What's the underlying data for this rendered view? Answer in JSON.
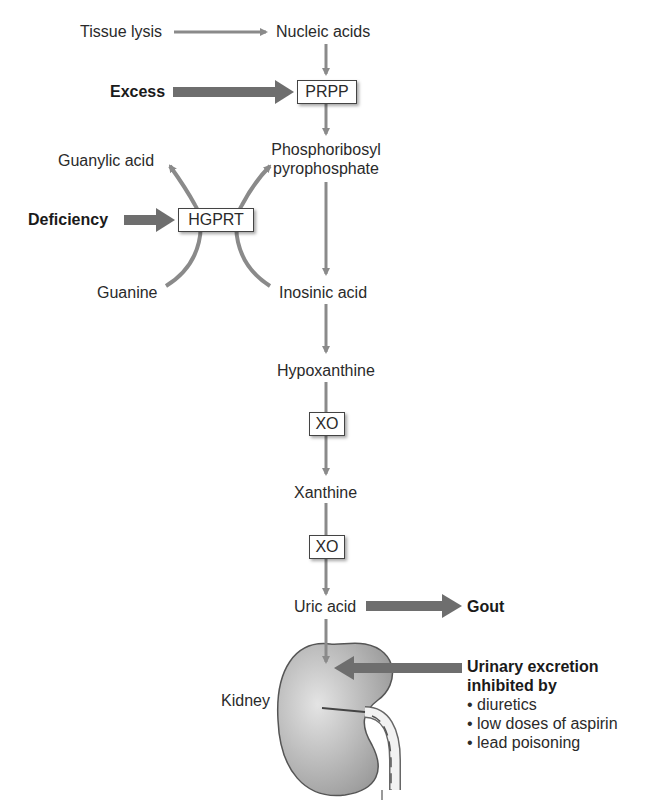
{
  "diagram": {
    "nodes": {
      "tissue_lysis": "Tissue lysis",
      "nucleic_acids": "Nucleic acids",
      "excess": "Excess",
      "prpp": "PRPP",
      "phosphoribosyl_line1": "Phosphoribosyl",
      "phosphoribosyl_line2": "pyrophosphate",
      "guanylic_acid": "Guanylic acid",
      "deficiency": "Deficiency",
      "hgprt": "HGPRT",
      "guanine": "Guanine",
      "inosinic_acid": "Inosinic acid",
      "hypoxanthine": "Hypoxanthine",
      "xo_1": "XO",
      "xanthine": "Xanthine",
      "xo_2": "XO",
      "uric_acid": "Uric acid",
      "gout": "Gout",
      "kidney": "Kidney"
    },
    "inhibition": {
      "title_line1": "Urinary excretion",
      "title_line2": "inhibited by",
      "items": [
        "• diuretics",
        "• low doses of aspirin",
        "• lead poisoning"
      ]
    },
    "colors": {
      "thin_arrow": "#8a8a8a",
      "thick_arrow": "#6e6e6e",
      "kidney_fill": "#b5b5b5",
      "box_border": "#444444"
    }
  }
}
